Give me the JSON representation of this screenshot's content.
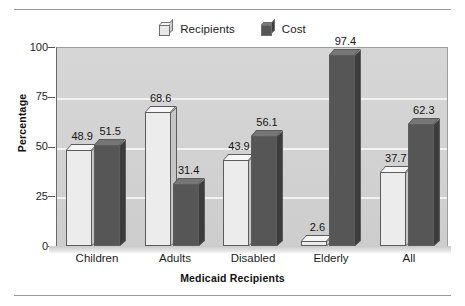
{
  "chart_data": {
    "type": "bar",
    "title": "",
    "xlabel": "Medicaid Recipients",
    "ylabel": "Percentage",
    "categories": [
      "Children",
      "Adults",
      "Disabled",
      "Elderly",
      "All"
    ],
    "series": [
      {
        "name": "Recipients",
        "values": [
          48.9,
          68.6,
          43.9,
          2.6,
          37.7
        ],
        "color": "#ececec"
      },
      {
        "name": "Cost",
        "values": [
          51.5,
          31.4,
          56.1,
          97.4,
          62.3
        ],
        "color": "#565656"
      }
    ],
    "ylim": [
      0,
      100
    ],
    "yticks": [
      0,
      25,
      50,
      75,
      100
    ],
    "ytick_labels": [
      "0",
      "25",
      "50",
      "75",
      "100"
    ],
    "grid": true,
    "grid_axis": "y",
    "legend_position": "top-center",
    "data_labels": true,
    "style": "3d-bar"
  },
  "legend": {
    "entries": [
      {
        "label": "Recipients",
        "swatch": "light-cube-icon"
      },
      {
        "label": "Cost",
        "swatch": "dark-cube-icon"
      }
    ]
  },
  "axes": {
    "y_title": "Percentage",
    "x_title": "Medicaid Recipients",
    "y_ticks": [
      "100",
      "75",
      "50",
      "25",
      "0"
    ],
    "x_ticks": [
      "Children",
      "Adults",
      "Disabled",
      "Elderly",
      "All"
    ]
  },
  "bar_labels": {
    "children": [
      "48.9",
      "51.5"
    ],
    "adults": [
      "68.6",
      "31.4"
    ],
    "disabled": [
      "43.9",
      "56.1"
    ],
    "elderly": [
      "2.6",
      "97.4"
    ],
    "all": [
      "37.7",
      "62.3"
    ]
  },
  "colors": {
    "recipients": "#ececec",
    "cost": "#565656",
    "plot_background": "#d2d2d2",
    "gridline": "#f2f2f2",
    "rule": "#9b9b9b",
    "text": "#1c1c1c"
  }
}
